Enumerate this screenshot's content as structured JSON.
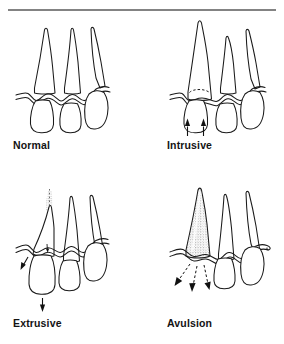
{
  "figure": {
    "background_color": "#ffffff",
    "stroke_color": "#1a1a1a",
    "label_color": "#131313",
    "top_rule": {
      "x1": 8,
      "y1": 10,
      "x2": 276,
      "y2": 10
    }
  },
  "panels": [
    {
      "id": "normal",
      "label": "Normal",
      "description": "Three teeth in normal alignment within the gingiva",
      "arrows": [],
      "stipple": false,
      "dashed_outline": false
    },
    {
      "id": "intrusive",
      "label": "Intrusive",
      "description": "Tooth driven upward into the socket; dashed arc marks original crown position",
      "arrows": [
        {
          "direction": "up",
          "style": "solid"
        },
        {
          "direction": "up",
          "style": "solid"
        }
      ],
      "stipple": false,
      "dashed_outline": true
    },
    {
      "id": "extrusive",
      "label": "Extrusive",
      "description": "Tooth partially displaced out of the socket; stippled apex shows vacated socket space",
      "arrows": [
        {
          "direction": "down-left",
          "style": "solid"
        },
        {
          "direction": "down",
          "style": "solid"
        }
      ],
      "stipple": true,
      "dashed_outline": false
    },
    {
      "id": "avulsion",
      "label": "Avulsion",
      "description": "Tooth completely displaced out of the socket; empty stippled socket remains",
      "arrows": [
        {
          "direction": "down-left",
          "style": "dashed"
        },
        {
          "direction": "down",
          "style": "dashed"
        },
        {
          "direction": "down-right",
          "style": "dashed"
        }
      ],
      "stipple": true,
      "dashed_outline": false
    }
  ]
}
